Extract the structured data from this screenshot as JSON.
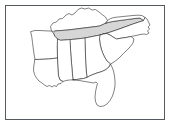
{
  "figure": {
    "caption": "",
    "frame_color": "#555a5e",
    "background_color": "#ffffff",
    "outline_color": "#1a1a1a",
    "highlight_color": "#d6d6d6"
  },
  "map": {
    "region_label": "Southeastern United States",
    "projection_note": "",
    "highlighted_state": "Tennessee",
    "states": [
      {
        "id": "kentucky",
        "name": "Kentucky",
        "abbr": "KY",
        "highlighted": false,
        "fill": "#ffffff",
        "path": "M 51.5 31.0 L 50.5 26.5 L 53.0 23.0 L 56.5 22.0 L 59.0 19.0 L 62.5 18.5 L 66.0 15.0 L 69.0 13.5 L 72.0 15.0 L 75.0 13.0 L 78.0 9.5 L 81.5 8.0 L 85.0 9.0 L 88.5 8.0 L 92.0 10.0 L 95.5 9.5 L 99.0 12.0 L 102.0 14.5 L 105.5 17.0 L 107.5 20.5 L 106.0 23.0 L 103.0 24.5 L 99.5 26.0 L 96.0 26.5 L 92.0 27.0 L 88.0 27.5 L 84.0 28.0 L 80.0 28.5 L 76.0 29.0 L 72.0 29.5 L 68.0 30.0 L 64.0 30.3 L 60.0 30.6 L 56.0 30.9 Z"
      },
      {
        "id": "tennessee",
        "name": "Tennessee",
        "abbr": "TN",
        "highlighted": true,
        "fill": "#d6d6d6",
        "path": "M 56.0 30.9 L 60.0 30.6 L 64.0 30.3 L 68.0 30.0 L 72.0 29.5 L 76.0 29.0 L 80.0 28.5 L 84.0 28.0 L 88.0 27.5 L 92.0 27.0 L 96.0 26.5 L 99.5 26.0 L 103.0 24.5 L 106.0 23.0 L 110.0 22.0 L 116.0 21.0 L 122.0 20.2 L 128.0 19.4 L 134.0 18.6 L 140.0 18.0 L 143.5 20.5 L 139.0 22.0 L 133.0 24.0 L 127.0 26.2 L 121.0 28.4 L 115.0 30.5 L 110.0 32.2 L 105.0 33.6 L 100.0 35.0 L 95.0 36.0 L 90.0 37.0 L 85.0 38.0 L 80.0 38.6 L 75.0 39.2 L 70.0 39.6 L 65.0 40.0 L 60.5 40.3 L 57.5 39.0 L 55.0 36.5 L 53.5 33.5 Z"
      },
      {
        "id": "virginia-edge",
        "name": "Virginia",
        "abbr": "VA",
        "highlighted": false,
        "fill": "#ffffff",
        "path": "M 106.0 23.0 L 107.5 20.5 L 110.5 18.5 L 114.0 17.5 L 118.0 17.0 L 123.0 16.5 L 128.0 16.0 L 133.0 15.5 L 138.0 15.2 L 142.0 15.5 L 145.0 17.5 L 143.5 20.5 L 140.0 18.0 L 134.0 18.6 L 128.0 19.4 L 122.0 20.2 L 116.0 21.0 L 110.0 22.0 Z"
      },
      {
        "id": "north-carolina",
        "name": "North Carolina",
        "abbr": "NC",
        "highlighted": false,
        "fill": "#ffffff",
        "path": "M 143.5 20.5 L 145.0 17.5 L 147.0 19.0 L 148.5 22.0 L 150.0 25.0 L 148.0 27.0 L 149.5 29.0 L 147.5 31.0 L 149.0 33.0 L 146.5 34.5 L 144.0 34.0 L 140.0 34.5 L 136.0 35.5 L 131.0 36.5 L 126.0 37.5 L 121.0 38.2 L 116.5 39.0 L 113.0 37.0 L 110.0 35.0 L 106.5 33.5 L 103.5 34.0 L 100.0 35.0 L 105.0 33.6 L 110.0 32.2 L 115.0 30.5 L 121.0 28.4 L 127.0 26.2 L 133.0 24.0 L 139.0 22.0 Z"
      },
      {
        "id": "south-carolina",
        "name": "South Carolina",
        "abbr": "SC",
        "highlighted": false,
        "fill": "#ffffff",
        "path": "M 100.0 35.0 L 103.5 34.0 L 106.5 33.5 L 110.0 35.0 L 113.0 37.0 L 116.5 39.0 L 121.0 38.2 L 126.0 37.5 L 131.0 36.5 L 134.0 39.0 L 133.0 43.0 L 130.0 47.0 L 126.0 51.0 L 122.0 55.0 L 118.0 59.0 L 114.0 62.0 L 110.5 64.0 L 107.0 61.0 L 104.5 57.0 L 102.5 52.5 L 101.0 48.0 L 100.0 43.5 L 99.5 39.0 Z"
      },
      {
        "id": "georgia",
        "name": "Georgia",
        "abbr": "GA",
        "highlighted": false,
        "fill": "#ffffff",
        "path": "M 85.0 38.0 L 90.0 37.0 L 95.0 36.0 L 100.0 35.0 L 99.5 39.0 L 100.0 43.5 L 101.0 48.0 L 102.5 52.5 L 104.5 57.0 L 107.0 61.0 L 110.5 64.0 L 109.0 67.0 L 106.0 69.5 L 102.0 71.5 L 97.0 73.0 L 93.0 74.5 L 89.5 76.0 L 87.0 77.5 L 86.5 73.0 L 86.0 68.0 L 85.7 62.0 L 85.5 56.0 L 85.3 50.0 L 85.1 44.0 Z"
      },
      {
        "id": "alabama",
        "name": "Alabama",
        "abbr": "AL",
        "highlighted": false,
        "fill": "#ffffff",
        "path": "M 70.0 39.6 L 75.0 39.2 L 80.0 38.6 L 85.0 38.0 L 85.1 44.0 L 85.3 50.0 L 85.5 56.0 L 85.7 62.0 L 86.0 68.0 L 86.5 73.0 L 87.0 77.5 L 83.5 78.5 L 80.0 79.0 L 76.5 79.5 L 73.0 79.8 L 72.5 75.0 L 72.0 69.0 L 71.5 63.0 L 71.0 57.0 L 70.6 51.0 L 70.3 45.0 Z"
      },
      {
        "id": "mississippi",
        "name": "Mississippi",
        "abbr": "MS",
        "highlighted": false,
        "fill": "#ffffff",
        "path": "M 57.5 39.0 L 60.5 40.3 L 65.0 40.0 L 70.0 39.6 L 70.3 45.0 L 70.6 51.0 L 71.0 57.0 L 71.5 63.0 L 72.0 69.0 L 72.5 75.0 L 73.0 79.8 L 69.5 80.0 L 66.0 80.5 L 63.0 81.5 L 60.0 80.0 L 58.5 76.0 L 58.0 70.0 L 57.7 64.0 L 57.5 58.0 L 57.3 52.0 L 57.2 46.0 Z"
      },
      {
        "id": "arkansas",
        "name": "Arkansas",
        "abbr": "AR",
        "highlighted": false,
        "fill": "#ffffff",
        "path": "M 31.0 31.5 L 35.0 30.5 L 40.0 30.5 L 45.0 30.8 L 50.0 31.0 L 51.5 31.0 L 53.5 33.5 L 55.0 36.5 L 57.5 39.0 L 57.2 46.0 L 57.3 52.0 L 57.5 58.0 L 53.0 58.5 L 48.5 59.0 L 44.0 59.2 L 39.5 59.4 L 35.0 59.5 L 34.0 54.0 L 33.2 48.0 L 32.5 42.5 L 31.8 37.0 Z"
      },
      {
        "id": "louisiana",
        "name": "Louisiana",
        "abbr": "LA",
        "highlighted": false,
        "fill": "#ffffff",
        "path": "M 35.0 59.5 L 39.5 59.4 L 44.0 59.2 L 48.5 59.0 L 53.0 58.5 L 57.5 58.0 L 57.7 64.0 L 58.0 70.0 L 58.5 76.0 L 60.0 80.0 L 63.0 81.5 L 61.0 83.5 L 58.0 84.0 L 56.5 86.5 L 54.0 85.5 L 52.0 87.0 L 49.5 85.5 L 47.0 86.5 L 44.5 85.0 L 42.0 83.0 L 39.0 81.0 L 36.5 78.0 L 34.5 74.5 L 33.5 70.5 L 33.8 66.0 L 34.4 62.5 Z"
      },
      {
        "id": "florida",
        "name": "Florida",
        "abbr": "FL",
        "highlighted": false,
        "fill": "#ffffff",
        "path": "M 73.0 79.8 L 76.5 79.5 L 80.0 79.0 L 83.5 78.5 L 87.0 77.5 L 89.5 76.0 L 93.0 74.5 L 97.0 73.0 L 102.0 71.5 L 106.0 69.5 L 109.0 67.0 L 110.5 64.0 L 112.0 67.0 L 113.5 71.0 L 114.5 76.0 L 115.0 81.0 L 115.0 86.0 L 114.0 91.0 L 112.5 96.0 L 110.0 100.5 L 107.0 104.0 L 103.5 106.0 L 100.0 106.5 L 97.0 105.0 L 95.5 101.5 L 95.0 97.0 L 95.5 92.0 L 96.5 87.0 L 97.5 83.5 L 96.0 82.0 L 93.5 83.0 L 91.0 82.5 L 88.0 82.0 L 85.0 81.5 L 82.0 81.0 L 79.0 80.5 L 76.0 80.2 Z"
      }
    ]
  }
}
